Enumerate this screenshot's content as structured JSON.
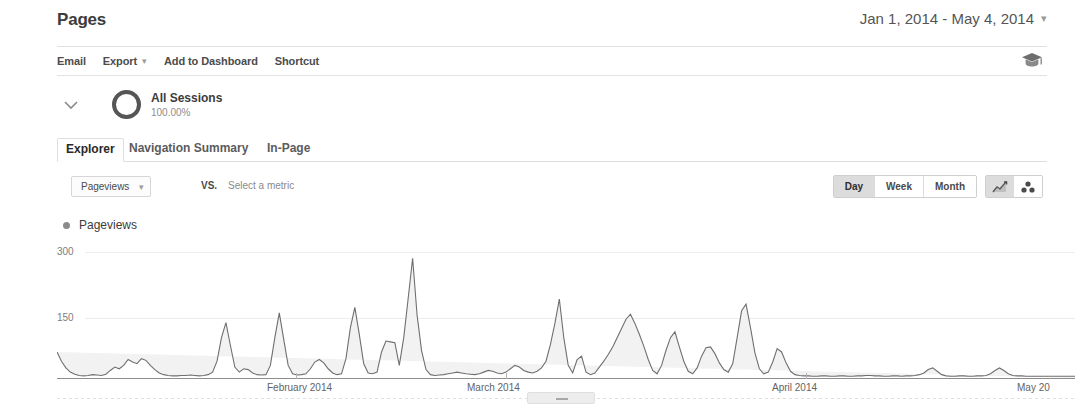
{
  "header": {
    "title": "Pages",
    "date_range": "Jan 1, 2014 - May 4, 2014",
    "date_range_caret": "▾"
  },
  "toolbar": {
    "items": [
      {
        "label": "Email",
        "name": "email"
      },
      {
        "label": "Export",
        "name": "export",
        "caret": "▾"
      },
      {
        "label": "Add to Dashboard",
        "name": "add-to-dashboard"
      },
      {
        "label": "Shortcut",
        "name": "shortcut"
      }
    ],
    "right_icon": "graduation-cap-icon"
  },
  "segment": {
    "expander_icon": "chevron-down-icon",
    "marker_icon": "donut-icon",
    "name": "All Sessions",
    "percent": "100.00%"
  },
  "tabs": [
    {
      "label": "Explorer",
      "active": true
    },
    {
      "label": "Navigation Summary",
      "active": false
    },
    {
      "label": "In-Page",
      "active": false
    }
  ],
  "metric_row": {
    "primary_metric": "Pageviews",
    "primary_caret": "▾",
    "vs_label": "VS.",
    "secondary_metric_placeholder": "Select a metric",
    "granularity": [
      {
        "label": "Day",
        "active": true
      },
      {
        "label": "Week",
        "active": false
      },
      {
        "label": "Month",
        "active": false
      }
    ],
    "chart_types": [
      {
        "name": "line-chart-icon",
        "active": true
      },
      {
        "name": "motion-chart-icon",
        "active": false
      }
    ]
  },
  "legend": {
    "series_label": "Pageviews",
    "series_color": "#8b8b8b"
  },
  "chart_data": {
    "type": "area",
    "title": "Pageviews",
    "xlabel": "",
    "ylabel": "Pageviews",
    "ylim": [
      0,
      300
    ],
    "yticks": [
      150,
      300
    ],
    "ytick_labels": [
      "150",
      "300"
    ],
    "grid": true,
    "legend_position": "top-left",
    "x_tick_labels": [
      "February 2014",
      "March 2014",
      "April 2014",
      "May 20"
    ],
    "x_tick_positions": [
      0.24,
      0.44,
      0.735,
      0.965
    ],
    "line_color": "#6f6f6f",
    "fill_color": "#f2f2f2",
    "series": [
      {
        "name": "Pageviews",
        "values": [
          62,
          40,
          24,
          14,
          9,
          6,
          5,
          6,
          8,
          7,
          6,
          9,
          18,
          26,
          22,
          30,
          44,
          38,
          34,
          46,
          42,
          30,
          20,
          12,
          8,
          6,
          5,
          5,
          6,
          6,
          7,
          6,
          5,
          6,
          8,
          14,
          40,
          96,
          132,
          78,
          26,
          14,
          22,
          20,
          12,
          8,
          7,
          8,
          30,
          96,
          155,
          92,
          30,
          10,
          7,
          8,
          10,
          22,
          38,
          44,
          36,
          22,
          12,
          8,
          10,
          46,
          120,
          168,
          104,
          34,
          12,
          10,
          14,
          62,
          88,
          86,
          84,
          30,
          96,
          190,
          285,
          150,
          66,
          20,
          8,
          6,
          7,
          8,
          10,
          12,
          14,
          12,
          10,
          9,
          8,
          10,
          14,
          18,
          16,
          12,
          10,
          14,
          22,
          30,
          26,
          18,
          14,
          12,
          16,
          24,
          40,
          80,
          130,
          188,
          96,
          30,
          12,
          44,
          52,
          14,
          8,
          12,
          26,
          40,
          56,
          74,
          96,
          118,
          140,
          152,
          130,
          104,
          76,
          44,
          18,
          10,
          30,
          66,
          96,
          110,
          74,
          40,
          16,
          10,
          24,
          52,
          72,
          74,
          58,
          36,
          20,
          14,
          34,
          96,
          160,
          176,
          120,
          60,
          22,
          10,
          14,
          38,
          70,
          62,
          36,
          16,
          8,
          6,
          5,
          5,
          4,
          4,
          5,
          5,
          4,
          4,
          5,
          5,
          4,
          4,
          5,
          5,
          6,
          6,
          5,
          5,
          4,
          4,
          5,
          5,
          4,
          5,
          5,
          6,
          8,
          12,
          20,
          24,
          16,
          8,
          5,
          4,
          4,
          5,
          5,
          4,
          4,
          5,
          5,
          6,
          10,
          18,
          24,
          18,
          10,
          6,
          5,
          5,
          4,
          4,
          4,
          4,
          4,
          4,
          4,
          4,
          4,
          4,
          4,
          4
        ]
      }
    ]
  }
}
